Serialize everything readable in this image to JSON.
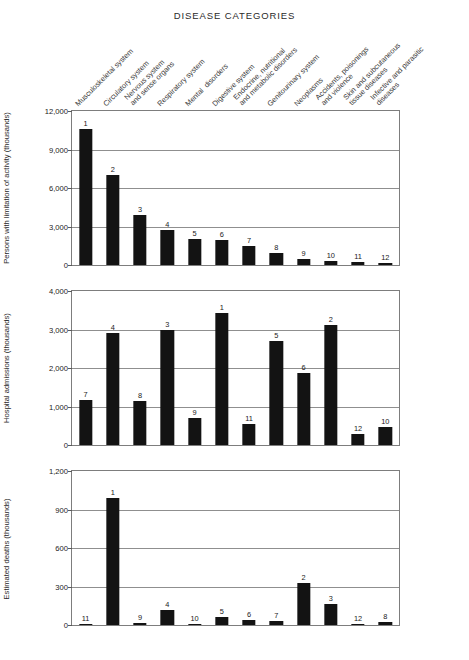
{
  "chart_title": "DISEASE CATEGORIES",
  "categories": [
    "Musculoskeletal system",
    "Circulatory system",
    "Nervous system\nand sense organs",
    "Respiratory system",
    "Mental  disorders",
    "Digestive system",
    "Endocrine, nutritional\nand metabolic disorders",
    "Genitourinary system",
    "Neoplasms",
    "Accidents, poisonings\nand violence",
    "Skin and subcutaneous\ntissue diseases",
    "Infective and parasitic\ndiseases"
  ],
  "chart_data": [
    {
      "type": "bar",
      "title": "DISEASE CATEGORIES",
      "ylabel": "Persons with limitation of activity (thousands)",
      "xlabel": "",
      "ylim": [
        0,
        12000
      ],
      "yticks": [
        0,
        3000,
        6000,
        9000,
        12000
      ],
      "ytick_labels": [
        "0",
        "3,000",
        "6,000",
        "9,000",
        "12,000"
      ],
      "grid": true,
      "legend": "none",
      "categories": [
        "Musculoskeletal system",
        "Circulatory system",
        "Nervous system and sense organs",
        "Respiratory system",
        "Mental disorders",
        "Digestive system",
        "Endocrine, nutritional and metabolic disorders",
        "Genitourinary system",
        "Neoplasms",
        "Accidents, poisonings and violence",
        "Skin and subcutaneous tissue diseases",
        "Infective and parasitic diseases"
      ],
      "values": [
        10600,
        7000,
        3900,
        2750,
        2050,
        1950,
        1450,
        900,
        480,
        330,
        200,
        130
      ],
      "rank_labels": [
        "1",
        "2",
        "3",
        "4",
        "5",
        "6",
        "7",
        "8",
        "9",
        "10",
        "11",
        "12"
      ]
    },
    {
      "type": "bar",
      "ylabel": "Hospital admissions (thousands)",
      "xlabel": "",
      "ylim": [
        0,
        4000
      ],
      "yticks": [
        0,
        1000,
        2000,
        3000,
        4000
      ],
      "ytick_labels": [
        "0",
        "1,000",
        "2,000",
        "3,000",
        "4,000"
      ],
      "grid": true,
      "legend": "none",
      "categories": [
        "Musculoskeletal system",
        "Circulatory system",
        "Nervous system and sense organs",
        "Respiratory system",
        "Mental disorders",
        "Digestive system",
        "Endocrine, nutritional and metabolic disorders",
        "Genitourinary system",
        "Neoplasms",
        "Accidents, poisonings and violence",
        "Skin and subcutaneous tissue diseases",
        "Infective and parasitic diseases"
      ],
      "values": [
        1180,
        2900,
        1150,
        3000,
        690,
        3430,
        540,
        2700,
        1860,
        3120,
        280,
        480
      ],
      "rank_labels": [
        "7",
        "4",
        "8",
        "3",
        "9",
        "1",
        "11",
        "5",
        "6",
        "2",
        "12",
        "10"
      ]
    },
    {
      "type": "bar",
      "ylabel": "Estimated deaths (thousands)",
      "xlabel": "",
      "ylim": [
        0,
        1200
      ],
      "yticks": [
        0,
        300,
        600,
        900,
        1200
      ],
      "ytick_labels": [
        "0",
        "300",
        "600",
        "900",
        "1,200"
      ],
      "grid": true,
      "legend": "none",
      "categories": [
        "Musculoskeletal system",
        "Circulatory system",
        "Nervous system and sense organs",
        "Respiratory system",
        "Mental disorders",
        "Digestive system",
        "Endocrine, nutritional and metabolic disorders",
        "Genitourinary system",
        "Neoplasms",
        "Accidents, poisonings and violence",
        "Skin and subcutaneous tissue diseases",
        "Infective and parasitic diseases"
      ],
      "values": [
        6,
        990,
        14,
        120,
        11,
        60,
        38,
        30,
        330,
        160,
        3,
        22
      ],
      "rank_labels": [
        "11",
        "1",
        "9",
        "4",
        "10",
        "5",
        "6",
        "7",
        "2",
        "3",
        "12",
        "8"
      ]
    }
  ]
}
